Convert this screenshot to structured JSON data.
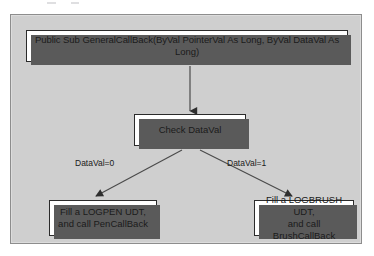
{
  "figure": {
    "kind": "flowchart",
    "orientation": "top-down",
    "background_color": "#cfcfcf",
    "node_fill_color": "#ffffff",
    "node_border_color": "#2b2b2b",
    "shadow_color": "#5a5a5a",
    "connector_color": "#4a4a4a"
  },
  "nodes": {
    "entry": {
      "id": "entry",
      "shape": "rectangle",
      "text": "Public Sub GeneralCallBack(ByVal PointerVal As Long, ByVal DataVal As Long)"
    },
    "decision": {
      "id": "decision",
      "shape": "rectangle",
      "text": "Check DataVal"
    },
    "pen": {
      "id": "pen",
      "shape": "rectangle",
      "text": "Fill a LOGPEN UDT,\nand call PenCallBack"
    },
    "brush": {
      "id": "brush",
      "shape": "rectangle",
      "text": "Fill a LOGBRUSH UDT,\nand call BrushCallBack"
    }
  },
  "edges": [
    {
      "id": "entry-to-decision",
      "from": "entry",
      "to": "decision",
      "label": "",
      "arrowhead": "filled-triangle",
      "direction": "down"
    },
    {
      "id": "decision-to-pen",
      "from": "decision",
      "to": "pen",
      "label": "DataVal=0",
      "arrowhead": "filled-triangle",
      "direction": "down-left"
    },
    {
      "id": "decision-to-brush",
      "from": "decision",
      "to": "brush",
      "label": "DataVal=1",
      "arrowhead": "filled-triangle",
      "direction": "down-right"
    }
  ],
  "edge_labels": {
    "zero": "DataVal=0",
    "one": "DataVal=1"
  }
}
